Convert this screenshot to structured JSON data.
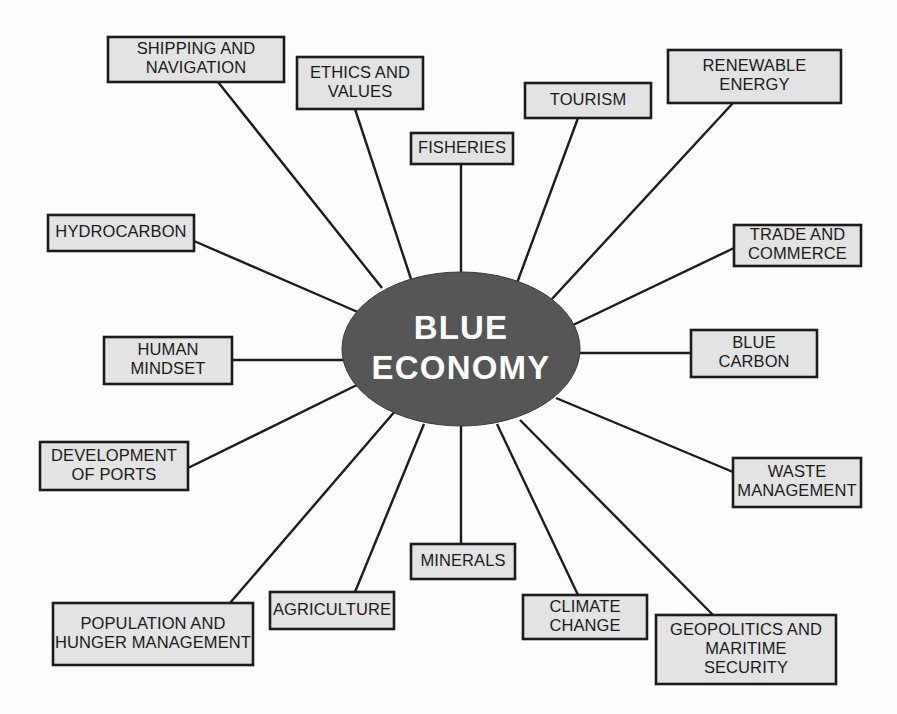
{
  "diagram": {
    "type": "hub-and-spoke-mind-map",
    "title": "Blue Economy",
    "hub": {
      "label_line1": "BLUE",
      "label_line2": "ECONOMY",
      "shape": "ellipse",
      "fill_color": "#565656",
      "text_color": "#ffffff",
      "cx": 461,
      "cy": 349,
      "rx": 119,
      "ry": 77
    },
    "style": {
      "node_fill": "#e3e3e3",
      "node_border": "#1c1c1c",
      "connector_color": "#1c1c1c",
      "background": "#fdfdfd"
    },
    "node_count": 16,
    "nodes": [
      {
        "id": "shipping-and-navigation",
        "lines": [
          "SHIPPING AND",
          "NAVIGATION"
        ],
        "x": 108,
        "y": 37,
        "w": 176,
        "h": 45,
        "anchor_x": 218,
        "anchor_y": 82,
        "hub_x": 382,
        "hub_y": 288
      },
      {
        "id": "ethics-and-values",
        "lines": [
          "ETHICS AND",
          "VALUES"
        ],
        "x": 297,
        "y": 57,
        "w": 126,
        "h": 52,
        "anchor_x": 355,
        "anchor_y": 109,
        "hub_x": 411,
        "hub_y": 279
      },
      {
        "id": "fisheries",
        "lines": [
          "FISHERIES"
        ],
        "x": 411,
        "y": 133,
        "w": 102,
        "h": 31,
        "anchor_x": 461,
        "anchor_y": 164,
        "hub_x": 461,
        "hub_y": 272
      },
      {
        "id": "tourism",
        "lines": [
          "TOURISM"
        ],
        "x": 525,
        "y": 83,
        "w": 126,
        "h": 35,
        "anchor_x": 578,
        "anchor_y": 118,
        "hub_x": 517,
        "hub_y": 283
      },
      {
        "id": "renewable-energy",
        "lines": [
          "RENEWABLE",
          "ENERGY"
        ],
        "x": 668,
        "y": 50,
        "w": 173,
        "h": 53,
        "anchor_x": 733,
        "anchor_y": 103,
        "hub_x": 551,
        "hub_y": 300
      },
      {
        "id": "trade-and-commerce",
        "lines": [
          "TRADE AND",
          "COMMERCE"
        ],
        "x": 734,
        "y": 225,
        "w": 127,
        "h": 41,
        "anchor_x": 734,
        "anchor_y": 248,
        "hub_x": 573,
        "hub_y": 325
      },
      {
        "id": "blue-carbon",
        "lines": [
          "BLUE",
          "CARBON"
        ],
        "x": 691,
        "y": 330,
        "w": 126,
        "h": 47,
        "anchor_x": 691,
        "anchor_y": 353,
        "hub_x": 580,
        "hub_y": 353
      },
      {
        "id": "waste-management",
        "lines": [
          "WASTE",
          "MANAGEMENT"
        ],
        "x": 733,
        "y": 458,
        "w": 128,
        "h": 49,
        "anchor_x": 733,
        "anchor_y": 472,
        "hub_x": 556,
        "hub_y": 398
      },
      {
        "id": "geopolitics-and-maritime-security",
        "lines": [
          "GEOPOLITICS AND",
          "MARITIME",
          "SECURITY"
        ],
        "x": 656,
        "y": 615,
        "w": 180,
        "h": 69,
        "anchor_x": 713,
        "anchor_y": 615,
        "hub_x": 520,
        "hub_y": 420
      },
      {
        "id": "climate-change",
        "lines": [
          "CLIMATE",
          "CHANGE"
        ],
        "x": 523,
        "y": 595,
        "w": 124,
        "h": 44,
        "anchor_x": 578,
        "anchor_y": 595,
        "hub_x": 497,
        "hub_y": 424
      },
      {
        "id": "minerals",
        "lines": [
          "MINERALS"
        ],
        "x": 411,
        "y": 544,
        "w": 104,
        "h": 35,
        "anchor_x": 461,
        "anchor_y": 544,
        "hub_x": 461,
        "hub_y": 426
      },
      {
        "id": "agriculture",
        "lines": [
          "AGRICULTURE"
        ],
        "x": 270,
        "y": 592,
        "w": 124,
        "h": 37,
        "anchor_x": 355,
        "anchor_y": 592,
        "hub_x": 424,
        "hub_y": 424
      },
      {
        "id": "population-and-hunger-management",
        "lines": [
          "POPULATION AND",
          "HUNGER MANAGEMENT"
        ],
        "x": 53,
        "y": 603,
        "w": 200,
        "h": 62,
        "anchor_x": 230,
        "anchor_y": 603,
        "hub_x": 396,
        "hub_y": 410
      },
      {
        "id": "development-of-ports",
        "lines": [
          "DEVELOPMENT",
          "OF PORTS"
        ],
        "x": 40,
        "y": 442,
        "w": 148,
        "h": 48,
        "anchor_x": 188,
        "anchor_y": 468,
        "hub_x": 365,
        "hub_y": 381
      },
      {
        "id": "human-mindset",
        "lines": [
          "HUMAN",
          "MINDSET"
        ],
        "x": 104,
        "y": 337,
        "w": 128,
        "h": 47,
        "anchor_x": 232,
        "anchor_y": 360,
        "hub_x": 343,
        "hub_y": 360
      },
      {
        "id": "hydrocarbon",
        "lines": [
          "HYDROCARBON"
        ],
        "x": 48,
        "y": 215,
        "w": 146,
        "h": 36,
        "anchor_x": 194,
        "anchor_y": 241,
        "hub_x": 360,
        "hub_y": 313
      }
    ]
  }
}
